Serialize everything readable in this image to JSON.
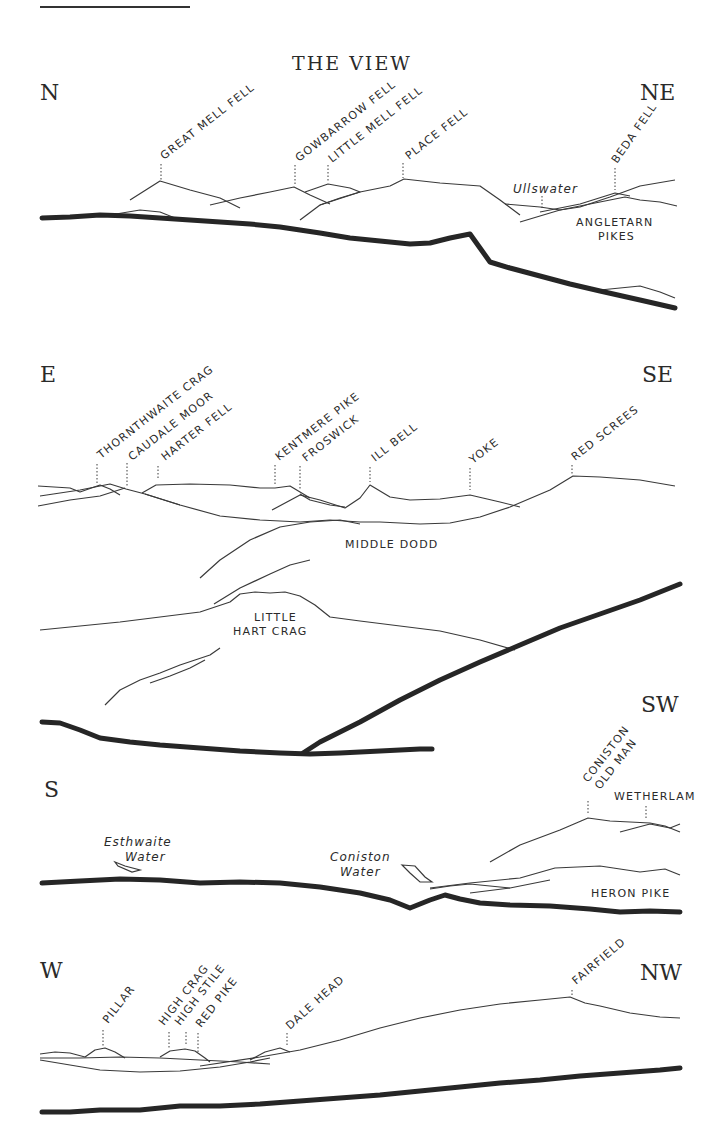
{
  "title": "THE VIEW",
  "colors": {
    "ink": "#2a2a2a",
    "background": "#ffffff"
  },
  "panels": [
    {
      "id": "n-ne",
      "compass_left": "N",
      "compass_right": "NE",
      "summits": [
        "GREAT MELL FELL",
        "GOWBARROW FELL",
        "LITTLE MELL FELL",
        "PLACE FELL",
        "BEDA FELL"
      ],
      "labels": [
        "Ullswater",
        "ANGLETARN",
        "PIKES"
      ]
    },
    {
      "id": "e-se",
      "compass_left": "E",
      "compass_right": "SE",
      "summits": [
        "THORNTHWAITE CRAG",
        "CAUDALE MOOR",
        "HARTER FELL",
        "KENTMERE PIKE",
        "FROSWICK",
        "ILL BELL",
        "YOKE",
        "RED SCREES"
      ],
      "labels": [
        "MIDDLE DODD",
        "LITTLE",
        "HART CRAG"
      ]
    },
    {
      "id": "s-sw",
      "compass_left": "S",
      "compass_right": "SW",
      "summits": [
        "CONISTON",
        "OLD MAN",
        "WETHERLAM"
      ],
      "labels": [
        "Esthwaite",
        "Water",
        "Coniston",
        "Water",
        "HERON PIKE"
      ]
    },
    {
      "id": "w-nw",
      "compass_left": "W",
      "compass_right": "NW",
      "summits": [
        "PILLAR",
        "HIGH CRAG",
        "HIGH STILE",
        "RED PIKE",
        "DALE HEAD",
        "FAIRFIELD"
      ],
      "labels": []
    }
  ]
}
